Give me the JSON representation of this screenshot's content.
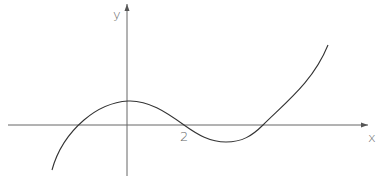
{
  "figure": {
    "type": "function-sketch",
    "axes": {
      "x_label": "x",
      "y_label": "y",
      "tick_labels": [
        {
          "axis": "x",
          "label": "2"
        }
      ],
      "color": "#555555"
    },
    "curve": {
      "color": "#333333",
      "features": [
        {
          "name": "left-end",
          "note": "starts below the x-axis at left"
        },
        {
          "name": "negative-x-intercept",
          "note": "crosses x-axis left of origin"
        },
        {
          "name": "local-maximum",
          "note": "on the positive y-axis"
        },
        {
          "name": "x-intercept-at-2",
          "value": 2
        },
        {
          "name": "local-minimum",
          "note": "below x-axis, right of x = 2"
        },
        {
          "name": "third-x-intercept",
          "note": "crosses x-axis after minimum"
        },
        {
          "name": "right-end",
          "note": "rises steeply to upper right"
        }
      ]
    }
  }
}
